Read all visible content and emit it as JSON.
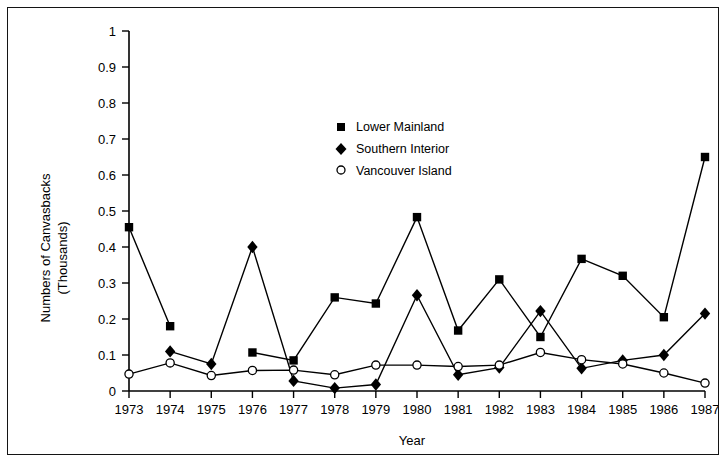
{
  "chart_data": {
    "type": "line",
    "title": "",
    "xlabel": "Year",
    "ylabel": "Numbers of Canvasbacks (Thousands)",
    "ylabel_line1": "Numbers of Canvasbacks",
    "ylabel_line2": "(Thousands)",
    "categories": [
      "1973",
      "1974",
      "1975",
      "1976",
      "1977",
      "1978",
      "1979",
      "1980",
      "1981",
      "1982",
      "1983",
      "1984",
      "1985",
      "1986",
      "1987"
    ],
    "x": [
      1973,
      1974,
      1975,
      1976,
      1977,
      1978,
      1979,
      1980,
      1981,
      1982,
      1983,
      1984,
      1985,
      1986,
      1987
    ],
    "ylim": [
      0,
      1
    ],
    "xlim": [
      1973,
      1987
    ],
    "yticks": [
      0,
      0.1,
      0.2,
      0.3,
      0.4,
      0.5,
      0.6,
      0.7,
      0.8,
      0.9,
      1
    ],
    "ytick_labels": [
      "0",
      "0.1",
      "0.2",
      "0.3",
      "0.4",
      "0.5",
      "0.6",
      "0.7",
      "0.8",
      "0.9",
      "1"
    ],
    "grid": false,
    "legend_position": "upper-center",
    "series": [
      {
        "name": "Lower Mainland",
        "marker": "filled-square",
        "color": "#000000",
        "values": [
          0.455,
          0.18,
          null,
          0.107,
          0.085,
          0.26,
          0.243,
          0.483,
          0.168,
          0.31,
          0.15,
          0.367,
          0.32,
          0.205,
          0.65
        ]
      },
      {
        "name": "Southern Interior",
        "marker": "filled-diamond",
        "color": "#000000",
        "values": [
          null,
          0.11,
          0.075,
          0.4,
          0.028,
          0.008,
          0.018,
          0.266,
          0.045,
          0.065,
          0.222,
          0.063,
          0.085,
          0.1,
          0.215
        ]
      },
      {
        "name": "Vancouver Island",
        "marker": "open-circle",
        "color": "#000000",
        "values": [
          0.047,
          0.078,
          0.043,
          0.057,
          0.058,
          0.045,
          0.072,
          0.072,
          0.068,
          0.072,
          0.107,
          0.087,
          0.075,
          0.05,
          0.022
        ]
      }
    ]
  },
  "legend": {
    "items": [
      {
        "label": "Lower Mainland",
        "marker": "filled-square"
      },
      {
        "label": "Southern Interior",
        "marker": "filled-diamond"
      },
      {
        "label": "Vancouver Island",
        "marker": "open-circle"
      }
    ]
  }
}
